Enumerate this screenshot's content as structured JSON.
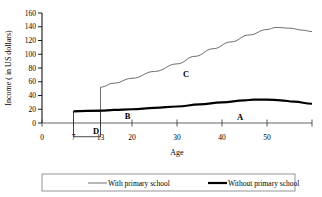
{
  "chart_data": {
    "type": "line",
    "title": "",
    "xlabel": "Age",
    "ylabel": "Income ( in US dollars)",
    "xlim": [
      0,
      60
    ],
    "ylim": [
      0,
      160
    ],
    "grid": false,
    "legend_position": "bottom",
    "x_ticks": [
      {
        "value": 0,
        "label": "0"
      },
      {
        "value": 7,
        "label": "7"
      },
      {
        "value": 13,
        "label": "13"
      },
      {
        "value": 20,
        "label": "20"
      },
      {
        "value": 30,
        "label": "30"
      },
      {
        "value": 40,
        "label": "40"
      },
      {
        "value": 50,
        "label": "50"
      },
      {
        "value": 60,
        "label": ""
      }
    ],
    "y_ticks": [
      {
        "value": 0,
        "label": "0"
      },
      {
        "value": 20,
        "label": "20"
      },
      {
        "value": 40,
        "label": "40"
      },
      {
        "value": 60,
        "label": "60"
      },
      {
        "value": 80,
        "label": "80"
      },
      {
        "value": 100,
        "label": "100"
      },
      {
        "value": 120,
        "label": "120"
      },
      {
        "value": 140,
        "label": "140"
      },
      {
        "value": 160,
        "label": "160"
      }
    ],
    "series": [
      {
        "name": "With primary school",
        "style": "thin",
        "color": "#555555",
        "x": [
          13,
          13,
          16,
          20,
          25,
          30,
          34,
          38,
          42,
          46,
          50,
          52,
          55,
          58,
          60
        ],
        "values": [
          18,
          52,
          58,
          65,
          75,
          86,
          97,
          108,
          118,
          128,
          136,
          139,
          138,
          135,
          133
        ]
      },
      {
        "name": "Without primary school",
        "style": "thick",
        "color": "#000000",
        "x": [
          7,
          13,
          16,
          20,
          25,
          30,
          35,
          40,
          45,
          47,
          50,
          53,
          56,
          60
        ],
        "values": [
          17,
          18,
          19,
          20,
          22,
          24,
          27,
          30,
          33,
          34,
          34,
          33,
          31,
          28
        ]
      }
    ],
    "annotations": [
      {
        "text": "A",
        "x": 44,
        "y": 9
      },
      {
        "text": "B",
        "x": 19,
        "y": 10
      },
      {
        "text": "C",
        "x": 32,
        "y": 71
      },
      {
        "text": "D",
        "x": 12,
        "y": -11
      }
    ],
    "shapes": [
      {
        "type": "rect",
        "name": "forgone-earnings-box",
        "x0": 7,
        "x1": 13,
        "y0": -20,
        "y1": 17
      }
    ]
  },
  "legend": {
    "items": [
      {
        "label": "With primary school",
        "style": "thin"
      },
      {
        "label": "Without primary school",
        "style": "thick"
      }
    ]
  }
}
